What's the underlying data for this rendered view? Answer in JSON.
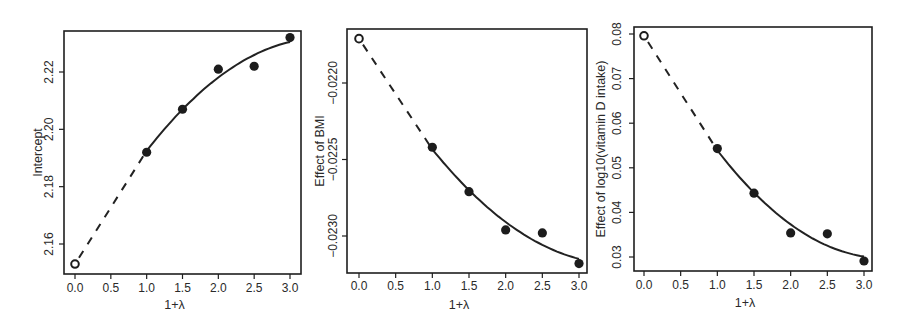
{
  "chart_data": [
    {
      "type": "scatter",
      "title": "",
      "xlabel": "1+λ",
      "ylabel": "Intercept",
      "xticks": [
        0.0,
        0.5,
        1.0,
        1.5,
        2.0,
        2.5,
        3.0
      ],
      "xtick_labels": [
        "0.0",
        "0.5",
        "1.0",
        "1.5",
        "2.0",
        "2.5",
        "3.0"
      ],
      "yticks": [
        2.16,
        2.18,
        2.2,
        2.22
      ],
      "ytick_labels": [
        "2.16",
        "2.18",
        "2.20",
        "2.22"
      ],
      "xlim": [
        -0.1,
        3.05
      ],
      "ylim": [
        2.151,
        2.234
      ],
      "grid": false,
      "legend": null,
      "points": {
        "x": [
          1.0,
          1.5,
          2.0,
          2.5,
          3.0
        ],
        "y": [
          2.192,
          2.207,
          2.221,
          2.222,
          2.232
        ]
      },
      "extrapolated_point": {
        "x": 0.0,
        "y": 2.153,
        "marker": "open-circle"
      },
      "fit_curve": {
        "style": "solid",
        "x_range": [
          1.0,
          3.0
        ],
        "model": "quadratic"
      },
      "extrapolation_curve": {
        "style": "dashed",
        "x_range": [
          0.0,
          1.0
        ]
      }
    },
    {
      "type": "scatter",
      "title": "",
      "xlabel": "1+λ",
      "ylabel": "Effect of BMI",
      "xticks": [
        0.0,
        0.5,
        1.0,
        1.5,
        2.0,
        2.5,
        3.0
      ],
      "xtick_labels": [
        "0.0",
        "0.5",
        "1.0",
        "1.5",
        "2.0",
        "2.5",
        "3.0"
      ],
      "yticks": [
        -0.023,
        -0.0225,
        -0.022
      ],
      "ytick_labels": [
        "-0.0230",
        "-0.0225",
        "-0.0220"
      ],
      "xlim": [
        -0.1,
        3.05
      ],
      "ylim": [
        -0.02328,
        -0.02168
      ],
      "grid": false,
      "legend": null,
      "points": {
        "x": [
          1.0,
          1.5,
          2.0,
          2.5,
          3.0
        ],
        "y": [
          -0.02242,
          -0.02271,
          -0.02296,
          -0.02298,
          -0.02318
        ]
      },
      "extrapolated_point": {
        "x": 0.0,
        "y": -0.02171,
        "marker": "open-circle"
      },
      "fit_curve": {
        "style": "solid",
        "x_range": [
          1.0,
          3.0
        ],
        "model": "quadratic"
      },
      "extrapolation_curve": {
        "style": "dashed",
        "x_range": [
          0.0,
          1.0
        ]
      }
    },
    {
      "type": "scatter",
      "title": "",
      "xlabel": "1+λ",
      "ylabel": "Effect of log10(vitamin D intake)",
      "xticks": [
        0.0,
        0.5,
        1.0,
        1.5,
        2.0,
        2.5,
        3.0
      ],
      "xtick_labels": [
        "0.0",
        "0.5",
        "1.0",
        "1.5",
        "2.0",
        "2.5",
        "3.0"
      ],
      "yticks": [
        0.03,
        0.04,
        0.05,
        0.06,
        0.07,
        0.08
      ],
      "ytick_labels": [
        "0.03",
        "0.04",
        "0.05",
        "0.06",
        "0.07",
        "0.08"
      ],
      "xlim": [
        -0.1,
        3.05
      ],
      "ylim": [
        0.0269,
        0.0815
      ],
      "grid": false,
      "legend": null,
      "points": {
        "x": [
          1.0,
          1.5,
          2.0,
          2.5,
          3.0
        ],
        "y": [
          0.0543,
          0.0443,
          0.0354,
          0.0352,
          0.0291
        ]
      },
      "extrapolated_point": {
        "x": 0.0,
        "y": 0.0796,
        "marker": "open-circle"
      },
      "fit_curve": {
        "style": "solid",
        "x_range": [
          1.0,
          3.0
        ],
        "model": "quadratic"
      },
      "extrapolation_curve": {
        "style": "dashed",
        "x_range": [
          0.0,
          1.0
        ]
      }
    }
  ],
  "panels": [
    {
      "frame": [
        64,
        31,
        301,
        274
      ],
      "x_px": [
        75,
        290
      ],
      "x_val": [
        0,
        3
      ],
      "y_px": [
        244,
        72
      ],
      "y_val": [
        2.16,
        2.22
      ],
      "ylabel_x": 42,
      "ytick_label_x": 53,
      "xlabel_y": 309,
      "xtick_label_y": 292
    },
    {
      "frame": [
        347,
        29,
        587,
        273
      ],
      "x_px": [
        359,
        579
      ],
      "x_val": [
        0,
        3
      ],
      "y_px": [
        236,
        83
      ],
      "y_val": [
        -0.023,
        -0.022
      ],
      "ylabel_x": 324,
      "ytick_label_x": 337,
      "xlabel_y": 309,
      "xtick_label_y": 290
    },
    {
      "frame": [
        634,
        27,
        872,
        271
      ],
      "x_px": [
        644,
        864
      ],
      "x_val": [
        0,
        3
      ],
      "y_px": [
        257,
        34
      ],
      "y_val": [
        0.03,
        0.08
      ],
      "ylabel_x": 605,
      "ytick_label_x": 621,
      "xlabel_y": 307,
      "xtick_label_y": 289
    }
  ]
}
